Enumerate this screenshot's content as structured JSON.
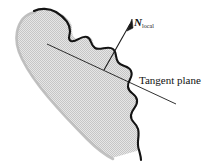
{
  "figure": {
    "background_color": "#ffffff"
  },
  "labels": {
    "normal_symbol": "N",
    "normal_subscript": "local",
    "tangent_plane": "Tangent plane"
  },
  "colors": {
    "outline": "#111111",
    "fill": "#d9d9d9",
    "soft_edge": "#c9c9c9",
    "line": "#1a1a1a",
    "text": "#111111"
  },
  "geometry": {
    "surface_fill_color": "#d9d9d9",
    "outline_color": "#111111",
    "normal_arrow": {
      "from_x": 104,
      "from_y": 70,
      "to_x": 131,
      "to_y": 22
    },
    "tangent_line": {
      "from_x": 47,
      "from_y": 44,
      "to_x": 176,
      "to_y": 104
    }
  }
}
